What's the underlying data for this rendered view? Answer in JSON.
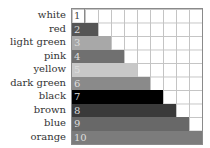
{
  "chart_data": {
    "type": "bar",
    "orientation": "horizontal",
    "title": "",
    "xlabel": "",
    "ylabel": "",
    "categories": [
      "white",
      "red",
      "light green",
      "pink",
      "yellow",
      "dark green",
      "black",
      "brown",
      "blue",
      "orange"
    ],
    "values": [
      1,
      2,
      3,
      4,
      5,
      6,
      7,
      8,
      9,
      10
    ],
    "bar_labels": [
      "1",
      "2",
      "3",
      "4",
      "5",
      "6",
      "7",
      "8",
      "9",
      "10"
    ],
    "bar_colors": [
      "#ffffff",
      "#555555",
      "#a8a8a8",
      "#707070",
      "#c8c8c8",
      "#8a8a8a",
      "#000000",
      "#3a3a3a",
      "#686868",
      "#7c7c7c"
    ],
    "xlim": [
      0,
      10
    ],
    "grid": true,
    "legend": "none"
  },
  "rows": [
    {
      "label": "white",
      "num": "1",
      "value": 1,
      "color": "#ffffff"
    },
    {
      "label": "red",
      "num": "2",
      "value": 2,
      "color": "#555555"
    },
    {
      "label": "light green",
      "num": "3",
      "value": 3,
      "color": "#a8a8a8"
    },
    {
      "label": "pink",
      "num": "4",
      "value": 4,
      "color": "#707070"
    },
    {
      "label": "yellow",
      "num": "5",
      "value": 5,
      "color": "#c8c8c8"
    },
    {
      "label": "dark green",
      "num": "6",
      "value": 6,
      "color": "#8a8a8a"
    },
    {
      "label": "black",
      "num": "7",
      "value": 7,
      "color": "#000000"
    },
    {
      "label": "brown",
      "num": "8",
      "value": 8,
      "color": "#3a3a3a"
    },
    {
      "label": "blue",
      "num": "9",
      "value": 9,
      "color": "#686868"
    },
    {
      "label": "orange",
      "num": "10",
      "value": 10,
      "color": "#7c7c7c"
    }
  ]
}
